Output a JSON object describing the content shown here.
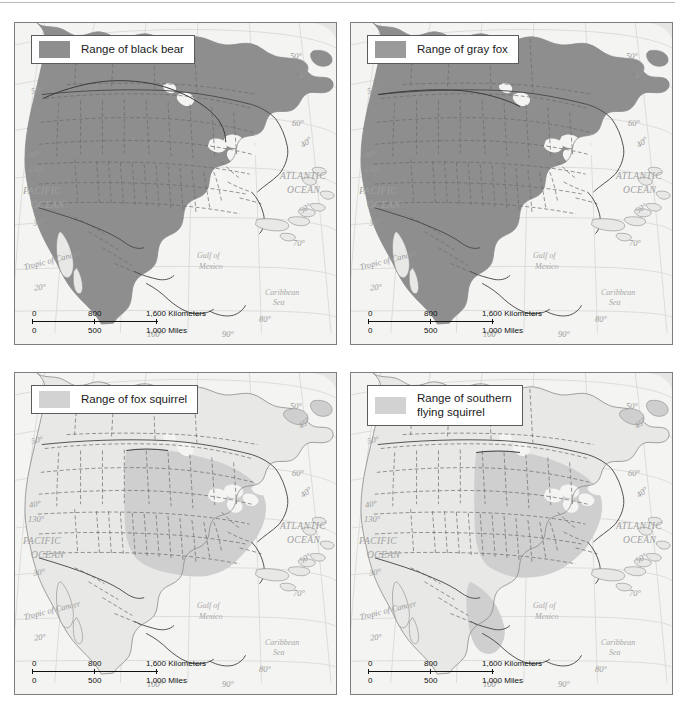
{
  "figure": {
    "type": "map-figure",
    "panel_count": 4,
    "projection_note": "North America species range maps",
    "colors": {
      "range_dark": "#8e8e8e",
      "range_light": "#cfcfcf",
      "land_outside_range": "#e8e8e6",
      "water": "#f4f4f2",
      "border_line": "#4a4a4a",
      "state_line": "#6b6b6b",
      "graticule": "#dcdcda",
      "panel_border": "#7d7d7d",
      "legend_bg": "#ffffff",
      "legend_text": "#1a1a1a"
    }
  },
  "panels": [
    {
      "id": "black-bear",
      "legend": {
        "label": "Range of black bear",
        "swatch_color": "#8e8e8e"
      },
      "range_tone": "dark",
      "range_description": "Most of Canada, Alaska, western US mountains, Great Lakes, Appalachians, Gulf coast, and Mexican sierras"
    },
    {
      "id": "gray-fox",
      "legend": {
        "label": "Range of gray fox",
        "swatch_color": "#9a9a9a"
      },
      "range_tone": "dark",
      "range_description": "Southern Canada border, nearly all of the United States except the northern Rockies and Great Basin, plus Mexico and Central America"
    },
    {
      "id": "fox-squirrel",
      "legend": {
        "label": "Range of fox squirrel",
        "swatch_color": "#d2d2d2"
      },
      "range_tone": "light",
      "range_description": "Central and eastern United States from the Great Plains to the Atlantic coast"
    },
    {
      "id": "southern-flying-squirrel",
      "legend": {
        "label": "Range of southern\nflying squirrel",
        "swatch_color": "#d2d2d2"
      },
      "range_tone": "light",
      "range_description": "Eastern United States from the Great Plains to the Atlantic, south into eastern Mexico and Central America"
    }
  ],
  "map_labels": {
    "oceans": [
      {
        "name": "PACIFIC OCEAN",
        "lines": [
          "PACIFIC",
          "OCEAN"
        ]
      },
      {
        "name": "ATLANTIC OCEAN",
        "lines": [
          "ATLANTIC",
          "OCEAN"
        ]
      }
    ],
    "seas": [
      {
        "name": "Gulf of Mexico",
        "lines": [
          "Gulf of",
          "Mexico"
        ]
      },
      {
        "name": "Caribbean Sea",
        "lines": [
          "Caribbean",
          "Sea"
        ]
      }
    ],
    "tropic": "Tropic of Cancer",
    "latitudes_west": [
      "50°",
      "40°",
      "30°",
      "20°"
    ],
    "longitude_west_top": "130°",
    "latitudes_east": [
      "50°",
      "60°",
      "70°",
      "80°"
    ],
    "latitudes_east_angled": [
      "45°",
      "40°",
      "50°"
    ],
    "longitudes_bottom": [
      "100°",
      "90°"
    ]
  },
  "scale_bar": {
    "kilometers": {
      "ticks": [
        "0",
        "800",
        "1,600"
      ],
      "unit": "Kilometers"
    },
    "miles": {
      "ticks": [
        "0",
        "500",
        "1,000"
      ],
      "unit": "Miles"
    }
  },
  "chart_data": {
    "type": "map",
    "panels": [
      {
        "label": "Range of black bear",
        "tone": "dark"
      },
      {
        "label": "Range of gray fox",
        "tone": "dark"
      },
      {
        "label": "Range of fox squirrel",
        "tone": "light"
      },
      {
        "label": "Range of southern flying squirrel",
        "tone": "light"
      }
    ]
  }
}
